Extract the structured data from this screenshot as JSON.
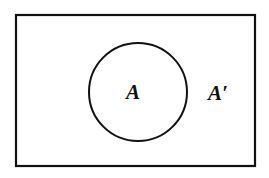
{
  "diagram": {
    "type": "venn",
    "universal_set": {
      "shape": "rectangle",
      "x": 16,
      "y": 15,
      "width": 239,
      "height": 151,
      "stroke": "#111111",
      "stroke_width": 2.2
    },
    "sets": [
      {
        "name": "A",
        "label": "A",
        "shape": "circle",
        "cx": 138,
        "cy": 92,
        "r": 49,
        "stroke": "#111111",
        "stroke_width": 2
      }
    ],
    "labels": {
      "set_a": "A",
      "complement": "A′"
    },
    "background": "#ffffff"
  }
}
